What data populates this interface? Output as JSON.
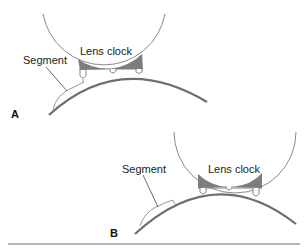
{
  "figure": {
    "panels": [
      {
        "id": "A",
        "panel_label": "A",
        "lens_clock_label": "Lens clock",
        "segment_label": "Segment"
      },
      {
        "id": "B",
        "panel_label": "B",
        "lens_clock_label": "Lens clock",
        "segment_label": "Segment"
      }
    ],
    "colors": {
      "line": "#7a7a7a",
      "lens": "#6e6e6e",
      "fill": "#7d7d7d",
      "text": "#222222"
    }
  }
}
